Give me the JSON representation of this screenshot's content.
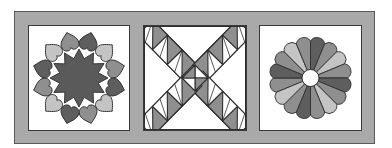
{
  "illustration": {
    "subject": "Three quilt blocks in a gray sashing frame",
    "frame_color": "#a9a9a9",
    "frame_outline": "#5a5a5a",
    "block_background": "#ffffff",
    "outline_color": "#2e2e2e",
    "palette": {
      "dark": "#5e5e5e",
      "medium": "#8f8f8f",
      "light": "#c4c4c4",
      "white": "#ffffff"
    },
    "blocks": [
      {
        "id": "hearts",
        "name": "Circle of Hearts",
        "center_star": {
          "points": 12,
          "color": "#5a5a5a"
        },
        "hearts": {
          "count": 12,
          "color_cycle": [
            "dark",
            "light",
            "medium"
          ],
          "orientation": "tips pointing toward center"
        }
      },
      {
        "id": "triangles",
        "name": "Half-Square Triangle X",
        "bands": 4,
        "units_per_band": 3,
        "unit_fill": "medium",
        "center": "diamond split into 4 triangles"
      },
      {
        "id": "dresden",
        "name": "Dresden Plate",
        "petals": 16,
        "color_cycle": [
          "dark",
          "medium",
          "light",
          "medium"
        ],
        "center_circle": "white"
      }
    ]
  }
}
